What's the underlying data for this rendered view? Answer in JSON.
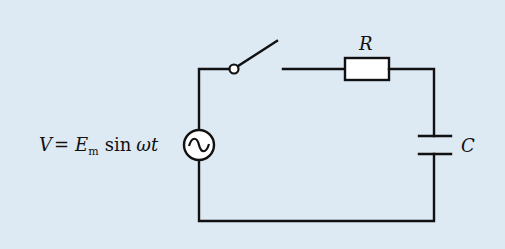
{
  "diagram": {
    "type": "circuit",
    "background_color": "#dde9f3",
    "line_color": "#111111",
    "components": [
      {
        "id": "source",
        "kind": "ac-voltage-source",
        "label": "V = E_m sin ωt"
      },
      {
        "id": "switch",
        "kind": "switch",
        "state": "open"
      },
      {
        "id": "resistor",
        "kind": "resistor",
        "label": "R"
      },
      {
        "id": "capacitor",
        "kind": "capacitor",
        "label": "C"
      }
    ],
    "labels": {
      "source_V": "V",
      "source_eq": "=",
      "source_E": "E",
      "source_sub": "m",
      "source_sin": "sin",
      "source_omega_t": "ωt",
      "resistor": "R",
      "capacitor": "C"
    },
    "connections": [
      [
        "source",
        "switch"
      ],
      [
        "switch",
        "resistor"
      ],
      [
        "resistor",
        "capacitor"
      ],
      [
        "capacitor",
        "source"
      ]
    ]
  }
}
